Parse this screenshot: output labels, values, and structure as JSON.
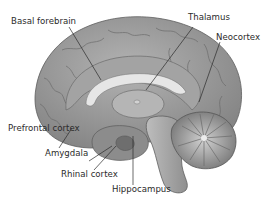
{
  "diagram": {
    "labels": [
      {
        "id": "basal-forebrain",
        "text": "Basal forebrain"
      },
      {
        "id": "thalamus",
        "text": "Thalamus"
      },
      {
        "id": "neocortex",
        "text": "Neocortex"
      },
      {
        "id": "prefrontal-cortex",
        "text": "Prefrontal cortex"
      },
      {
        "id": "amygdala",
        "text": "Amygdala"
      },
      {
        "id": "rhinal-cortex",
        "text": "Rhinal cortex"
      },
      {
        "id": "hippocampus",
        "text": "Hippocampus"
      }
    ],
    "colors": {
      "cortex": "#9a9a9a",
      "cortex_dark": "#6f6f6f",
      "inner": "#b8b8b8",
      "corpus_callosum": "#e4e4e4",
      "brainstem": "#a9a9a9",
      "cerebellum": "#8a8a8a",
      "leader_line": "#2b2b2b",
      "text": "#2b2b2b"
    }
  }
}
